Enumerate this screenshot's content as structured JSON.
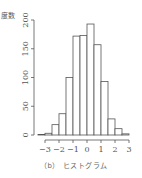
{
  "chart_data": {
    "type": "bar",
    "subtype": "histogram",
    "title": "",
    "caption": "（b） ヒストグラム",
    "xlabel": "",
    "ylabel": "度数",
    "bin_edges": [
      -3.5,
      -3.0,
      -2.5,
      -2.0,
      -1.5,
      -1.0,
      -0.5,
      0.0,
      0.5,
      1.0,
      1.5,
      2.0,
      2.5,
      3.0
    ],
    "values": [
      1,
      3,
      18,
      37,
      100,
      172,
      173,
      193,
      157,
      93,
      28,
      11,
      2
    ],
    "xticks": [
      -3,
      -2,
      -1,
      0,
      1,
      2,
      3
    ],
    "xtick_labels": [
      "−3",
      "−2",
      "−1",
      "0",
      "1",
      "2",
      "3"
    ],
    "yticks": [
      0,
      50,
      100,
      150,
      200
    ],
    "ytick_labels": [
      "0",
      "50",
      "100",
      "150",
      "200"
    ],
    "xlim": [
      -3.5,
      3.0
    ],
    "ylim": [
      0,
      200
    ],
    "grid": false,
    "legend": null,
    "colors": {
      "bar_fill": "#ffffff",
      "bar_edge": "#555555",
      "axis": "#555555"
    }
  }
}
